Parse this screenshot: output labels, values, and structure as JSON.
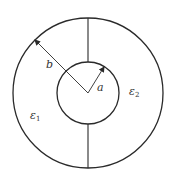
{
  "diagram": {
    "type": "coaxial-capacitor-cross-section",
    "colors": {
      "stroke": "#2a2a2a",
      "background": "#ffffff",
      "text": "#333333"
    },
    "outer_circle": {
      "label": "b",
      "cx": 88,
      "cy": 93,
      "r": 75
    },
    "inner_circle": {
      "label": "a",
      "cx": 88,
      "cy": 93,
      "r": 31
    },
    "labels": {
      "b": "b",
      "a": "a",
      "eps1_symbol": "ε",
      "eps1_sub": "1",
      "eps2_symbol": "ε",
      "eps2_sub": "2"
    }
  }
}
